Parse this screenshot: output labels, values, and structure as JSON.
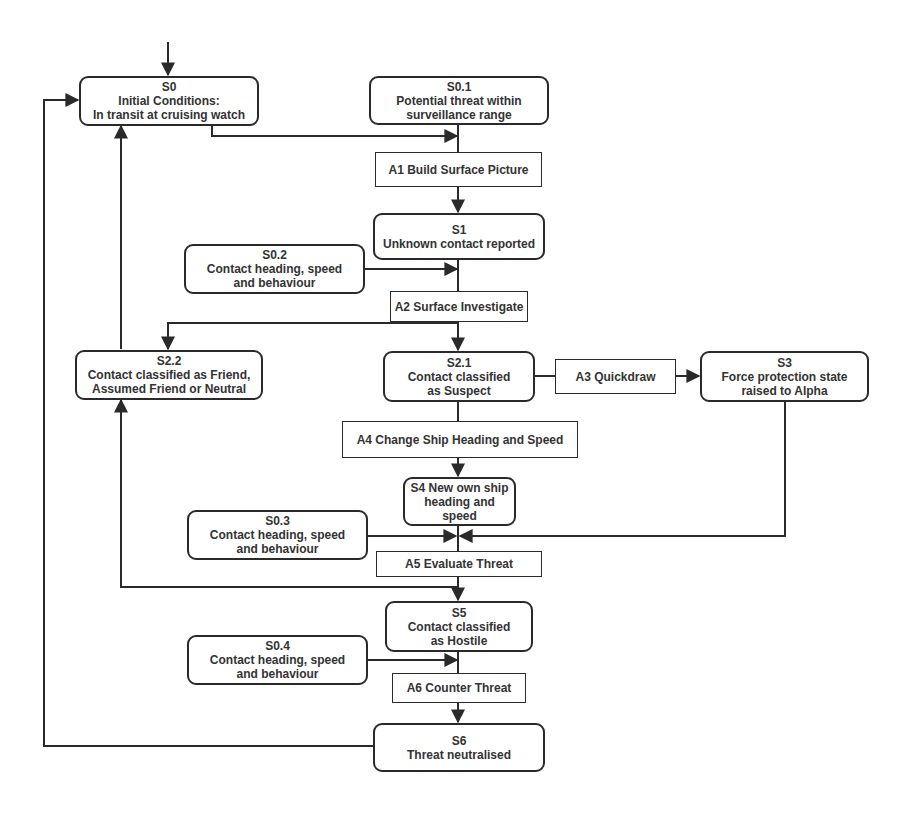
{
  "diagram": {
    "type": "state-transition flowchart",
    "states": {
      "s0": {
        "id": "S0",
        "lines": [
          "Initial Conditions:",
          "In transit at cruising watch"
        ]
      },
      "s0_1": {
        "id": "S0.1",
        "lines": [
          "Potential threat within",
          "surveillance range"
        ]
      },
      "s1": {
        "id": "S1",
        "lines": [
          "Unknown contact reported"
        ]
      },
      "s0_2": {
        "id": "S0.2",
        "lines": [
          "Contact heading, speed",
          "and behaviour"
        ]
      },
      "s2_2": {
        "id": "S2.2",
        "lines": [
          "Contact classified as Friend,",
          "Assumed Friend or Neutral"
        ]
      },
      "s2_1": {
        "id": "S2.1",
        "lines": [
          "Contact classified",
          "as Suspect"
        ]
      },
      "s3": {
        "id": "S3",
        "lines": [
          "Force protection state",
          "raised to Alpha"
        ]
      },
      "s4": {
        "id": "S4",
        "lines": [
          "New own ship",
          "heading and",
          "speed"
        ]
      },
      "s0_3": {
        "id": "S0.3",
        "lines": [
          "Contact heading, speed",
          "and behaviour"
        ]
      },
      "s5": {
        "id": "S5",
        "lines": [
          "Contact classified",
          "as Hostile"
        ]
      },
      "s0_4": {
        "id": "S0.4",
        "lines": [
          "Contact heading, speed",
          "and behaviour"
        ]
      },
      "s6": {
        "id": "S6",
        "lines": [
          "Threat neutralised"
        ]
      }
    },
    "actions": {
      "a1": "A1 Build Surface Picture",
      "a2": "A2 Surface Investigate",
      "a3": "A3 Quickdraw",
      "a4": "A4 Change Ship Heading and Speed",
      "a5": "A5 Evaluate Threat",
      "a6": "A6 Counter Threat"
    },
    "edges": [
      [
        "start",
        "S0"
      ],
      [
        "S0",
        "A1"
      ],
      [
        "S0.1",
        "A1"
      ],
      [
        "A1",
        "S1"
      ],
      [
        "S1",
        "A2"
      ],
      [
        "S0.2",
        "A2"
      ],
      [
        "A2",
        "S2.1"
      ],
      [
        "A2",
        "S2.2"
      ],
      [
        "S2.2",
        "S0"
      ],
      [
        "S2.1",
        "A3"
      ],
      [
        "A3",
        "S3"
      ],
      [
        "S2.1",
        "A4"
      ],
      [
        "A4",
        "S4"
      ],
      [
        "S4",
        "A5"
      ],
      [
        "S0.3",
        "A5"
      ],
      [
        "S3",
        "A5"
      ],
      [
        "A5",
        "S5"
      ],
      [
        "A5",
        "S2.2"
      ],
      [
        "S5",
        "A6"
      ],
      [
        "S0.4",
        "A6"
      ],
      [
        "A6",
        "S6"
      ],
      [
        "S6",
        "S0"
      ]
    ],
    "colors": {
      "line": "#2a2a2a",
      "box_fill": "#ffffff",
      "text": "#333333"
    }
  }
}
